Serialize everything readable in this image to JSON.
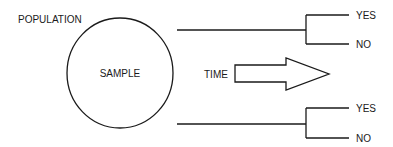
{
  "diagram": {
    "population_label": "POPULATION",
    "sample_label": "SAMPLE",
    "time_label": "TIME",
    "branches": [
      {
        "outcomes": [
          "YES",
          "NO"
        ]
      },
      {
        "outcomes": [
          "YES",
          "NO"
        ]
      }
    ],
    "colors": {
      "stroke": "#1a1a1a",
      "background": "#ffffff"
    }
  }
}
